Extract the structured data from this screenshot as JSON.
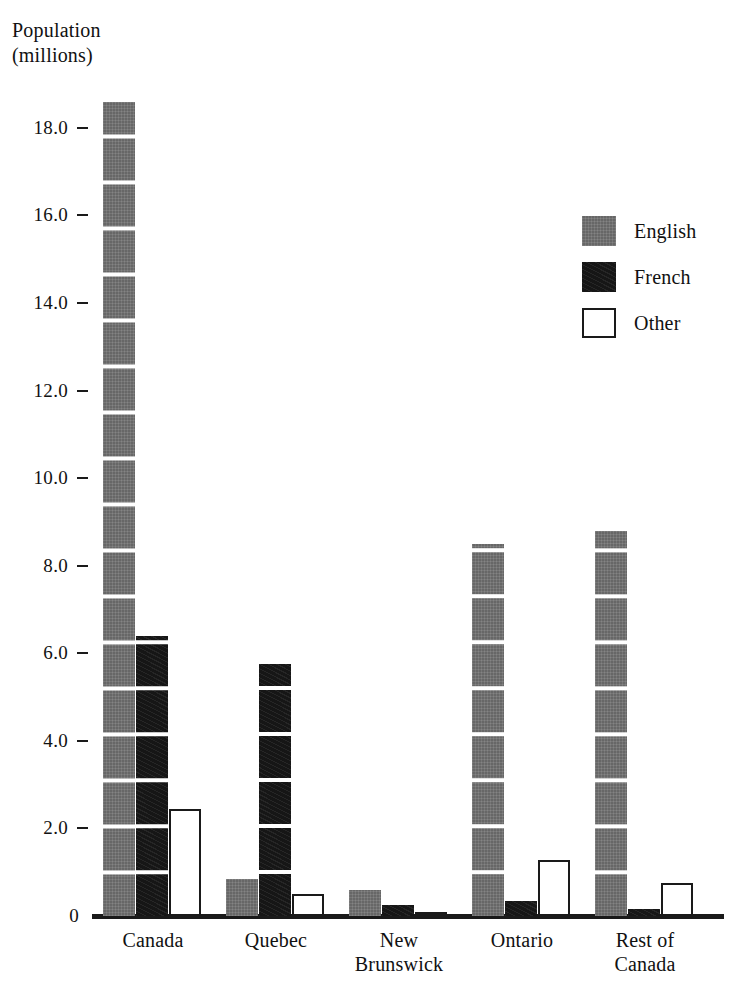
{
  "chart_data": {
    "type": "bar",
    "title": "",
    "ylabel": "Population\n(millions)",
    "xlabel": "",
    "categories": [
      "Canada",
      "Quebec",
      "New\nBrunswick",
      "Ontario",
      "Rest of\nCanada"
    ],
    "series": [
      {
        "name": "English",
        "color": "#676767",
        "values": [
          18.6,
          0.85,
          0.6,
          8.5,
          8.8
        ]
      },
      {
        "name": "French",
        "color": "#161616",
        "values": [
          6.4,
          5.75,
          0.25,
          0.35,
          0.15
        ]
      },
      {
        "name": "Other",
        "color": "#ffffff",
        "values": [
          2.45,
          0.5,
          0.1,
          1.27,
          0.75
        ]
      }
    ],
    "ylim": [
      0,
      19
    ],
    "yticks": [
      "18.0",
      "16.0",
      "14.0",
      "12.0",
      "10.0",
      "8.0",
      "6.0",
      "4.0",
      "2.0",
      "0"
    ],
    "ytick_values": [
      18,
      16,
      14,
      12,
      10,
      8,
      6,
      4,
      2,
      0
    ],
    "grid": false,
    "legend_position": "upper right",
    "legend": [
      "English",
      "French",
      "Other"
    ]
  },
  "axis": {
    "y_title": "Population\n(millions)"
  },
  "legend": {
    "items": [
      {
        "label": "English"
      },
      {
        "label": "French"
      },
      {
        "label": "Other"
      }
    ]
  },
  "caption": {
    "fragment": ""
  }
}
